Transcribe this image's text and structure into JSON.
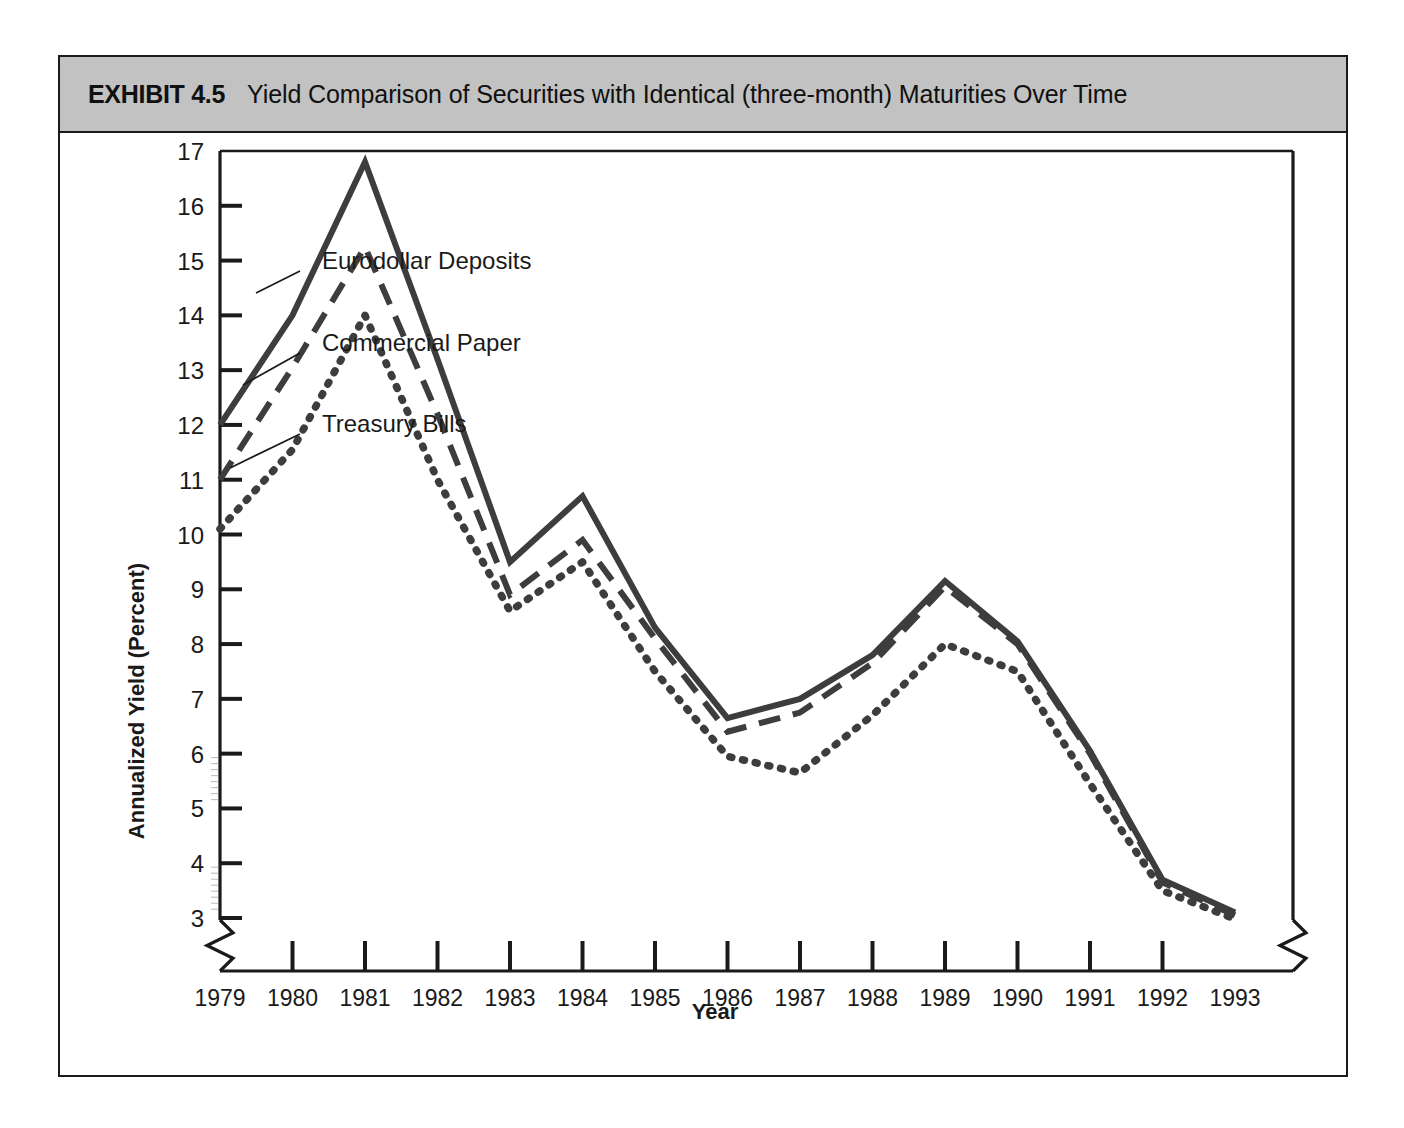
{
  "exhibit": {
    "number": "EXHIBIT 4.5",
    "title": "Yield Comparison of Securities with Identical (three-month) Maturities Over Time"
  },
  "chart_data": {
    "type": "line",
    "title": "Yield Comparison of Securities with Identical (three-month) Maturities Over Time",
    "xlabel": "Year",
    "ylabel": "Annualized Yield (Percent)",
    "categories": [
      "1979",
      "1980",
      "1981",
      "1982",
      "1983",
      "1984",
      "1985",
      "1986",
      "1987",
      "1988",
      "1989",
      "1990",
      "1991",
      "1992",
      "1993"
    ],
    "x": [
      1979,
      1980,
      1981,
      1982,
      1983,
      1984,
      1985,
      1986,
      1987,
      1988,
      1989,
      1990,
      1991,
      1992,
      1993
    ],
    "ylim": [
      3,
      17
    ],
    "yticks": [
      3,
      4,
      5,
      6,
      7,
      8,
      9,
      10,
      11,
      12,
      13,
      14,
      15,
      16,
      17
    ],
    "ytick_labels": [
      "3",
      "4",
      "5",
      "6",
      "7",
      "8",
      "9",
      "10",
      "11",
      "12",
      "13",
      "14",
      "15",
      "16",
      "17"
    ],
    "xtick_labels": [
      "1979",
      "1980",
      "1981",
      "1982",
      "1983",
      "1984",
      "1985",
      "1986",
      "1987",
      "1988",
      "1989",
      "1990",
      "1991",
      "1992",
      "1993"
    ],
    "grid": false,
    "axis_break": true,
    "legend_position": "inline-annotations",
    "series": [
      {
        "name": "Eurodollar Deposits",
        "style": "solid",
        "color": "#3d3d3d",
        "values": [
          12.0,
          14.0,
          16.8,
          13.2,
          9.5,
          10.7,
          8.3,
          6.65,
          7.0,
          7.8,
          9.15,
          8.05,
          6.05,
          3.7,
          3.1
        ]
      },
      {
        "name": "Commercial Paper",
        "style": "dashed",
        "color": "#3d3d3d",
        "values": [
          11.0,
          13.05,
          15.25,
          12.2,
          8.9,
          9.9,
          8.1,
          6.4,
          6.75,
          7.65,
          9.05,
          8.0,
          6.0,
          3.65,
          3.05
        ]
      },
      {
        "name": "Treasury Bills",
        "style": "dotted",
        "color": "#3d3d3d",
        "values": [
          10.1,
          11.55,
          14.0,
          11.0,
          8.6,
          9.5,
          7.5,
          5.95,
          5.65,
          6.7,
          8.0,
          7.5,
          5.45,
          3.5,
          2.98
        ]
      }
    ],
    "annotations": [
      {
        "text": "Eurodollar Deposits",
        "series": "Eurodollar Deposits"
      },
      {
        "text": "Commercial Paper",
        "series": "Commercial Paper"
      },
      {
        "text": "Treasury Bills",
        "series": "Treasury Bills"
      }
    ]
  },
  "colors": {
    "title_bar": "#c2c2c2",
    "line": "#3d3d3d",
    "frame": "#1a1a1a",
    "background": "#ffffff"
  }
}
